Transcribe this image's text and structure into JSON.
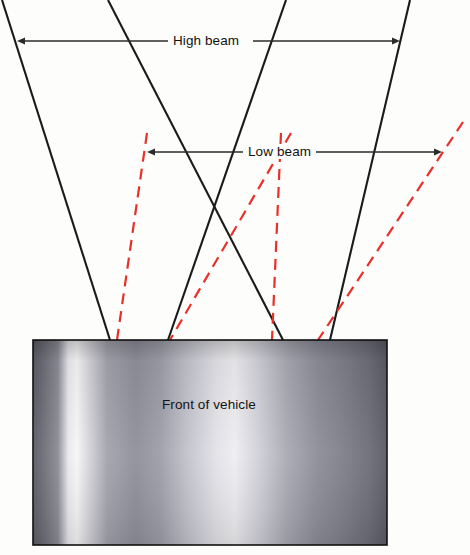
{
  "diagram": {
    "background_color": "#fdfdfb",
    "labels": {
      "high_beam": "High beam",
      "low_beam": "Low beam",
      "vehicle": "Front of vehicle"
    },
    "colors": {
      "high_beam_line": "#1a1a1a",
      "low_beam_line": "#e8302a",
      "arrow": "#2b2b2b",
      "vehicle_border": "#111111",
      "vehicle_light": "#f2f2f4",
      "vehicle_mid": "#a9a9b4",
      "vehicle_dark": "#55555f"
    },
    "high_beam_arrow": {
      "x1": 25,
      "x2": 392,
      "y": 41,
      "double_headed": true
    },
    "low_beam_arrow": {
      "x1": 155,
      "x2": 434,
      "y": 152,
      "double_headed": true
    },
    "vehicle_rect": {
      "x": 33,
      "y": 340,
      "width": 354,
      "height": 205
    },
    "high_beam_rays": [
      {
        "x_top": 2,
        "y_top": 0,
        "x_bottom": 110,
        "y_bottom": 340
      },
      {
        "x_top": 108,
        "y_top": 0,
        "x_bottom": 283,
        "y_bottom": 340
      },
      {
        "x_top": 286,
        "y_top": 0,
        "x_bottom": 168,
        "y_bottom": 340
      },
      {
        "x_top": 410,
        "y_top": 0,
        "x_bottom": 330,
        "y_bottom": 340
      }
    ],
    "low_beam_rays": [
      {
        "x_top": 147,
        "y_top": 133,
        "x_bottom": 117,
        "y_bottom": 340
      },
      {
        "x_top": 281,
        "y_top": 133,
        "x_bottom": 272,
        "y_bottom": 340
      },
      {
        "x_top": 291,
        "y_top": 133,
        "x_bottom": 170,
        "y_bottom": 340
      },
      {
        "x_top": 463,
        "y_top": 122,
        "x_bottom": 318,
        "y_bottom": 340
      }
    ]
  }
}
